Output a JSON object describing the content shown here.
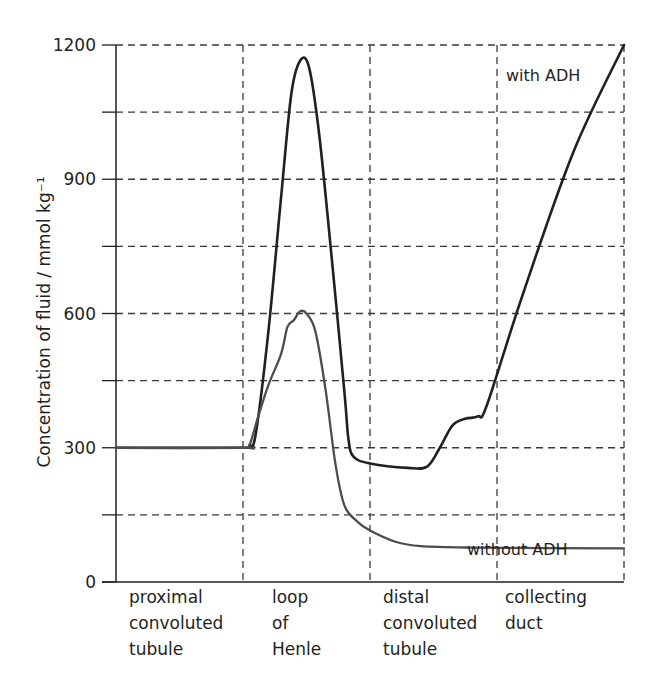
{
  "chart_data": {
    "type": "line",
    "title": "",
    "xlabel": "",
    "ylabel": "Concentration of fluid / mmol kg⁻¹",
    "ylim": [
      0,
      1200
    ],
    "yticks": [
      0,
      300,
      600,
      900,
      1200
    ],
    "minor_yticks": [
      150,
      450,
      750,
      1050
    ],
    "grid": true,
    "grid_style": "dashed",
    "x_regions": [
      {
        "label": "proximal\nconvoluted\ntubule"
      },
      {
        "label": "loop\nof\nHenle"
      },
      {
        "label": "distal\nconvoluted\ntubule"
      },
      {
        "label": "collecting\nduct"
      }
    ],
    "x_range": [
      0,
      4
    ],
    "series": [
      {
        "name": "with ADH",
        "color": "#231f20",
        "points": [
          [
            0.0,
            300
          ],
          [
            1.0,
            300
          ],
          [
            1.05,
            305
          ],
          [
            1.1,
            330
          ],
          [
            1.2,
            560
          ],
          [
            1.3,
            860
          ],
          [
            1.38,
            1090
          ],
          [
            1.45,
            1165
          ],
          [
            1.52,
            1150
          ],
          [
            1.6,
            1000
          ],
          [
            1.7,
            720
          ],
          [
            1.8,
            420
          ],
          [
            1.83,
            320
          ],
          [
            1.87,
            280
          ],
          [
            2.0,
            265
          ],
          [
            2.3,
            255
          ],
          [
            2.45,
            258
          ],
          [
            2.55,
            300
          ],
          [
            2.65,
            350
          ],
          [
            2.75,
            365
          ],
          [
            2.85,
            370
          ],
          [
            2.92,
            395
          ],
          [
            3.2,
            640
          ],
          [
            3.6,
            960
          ],
          [
            4.0,
            1200
          ]
        ]
      },
      {
        "name": "without ADH",
        "color": "#4d4d4d",
        "points": [
          [
            0.0,
            300
          ],
          [
            1.0,
            300
          ],
          [
            1.05,
            305
          ],
          [
            1.12,
            370
          ],
          [
            1.2,
            440
          ],
          [
            1.3,
            510
          ],
          [
            1.35,
            570
          ],
          [
            1.4,
            585
          ],
          [
            1.45,
            605
          ],
          [
            1.5,
            600
          ],
          [
            1.57,
            560
          ],
          [
            1.65,
            430
          ],
          [
            1.73,
            260
          ],
          [
            1.8,
            170
          ],
          [
            1.9,
            135
          ],
          [
            2.0,
            115
          ],
          [
            2.2,
            90
          ],
          [
            2.4,
            80
          ],
          [
            2.8,
            77
          ],
          [
            4.0,
            75
          ]
        ]
      }
    ],
    "annotations": [
      {
        "text": "with ADH",
        "series": "with ADH"
      },
      {
        "text": "without ADH",
        "series": "without ADH"
      }
    ]
  }
}
